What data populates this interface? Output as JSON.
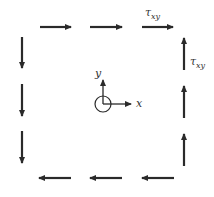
{
  "diagram": {
    "colors": {
      "stroke": "#2a2a2a",
      "text": "#333333",
      "background": "#ffffff"
    },
    "labels": {
      "tau_top": {
        "symbol": "τ",
        "sub": "xy"
      },
      "tau_right": {
        "symbol": "τ",
        "sub": "xy"
      },
      "axis_x": "x",
      "axis_y": "y"
    },
    "edges": {
      "top": {
        "direction": "right",
        "arrow_count": 3
      },
      "right": {
        "direction": "up",
        "arrow_count": 3
      },
      "bottom": {
        "direction": "left",
        "arrow_count": 3
      },
      "left": {
        "direction": "down",
        "arrow_count": 3
      }
    },
    "origin_marker": "circle-with-axes"
  }
}
